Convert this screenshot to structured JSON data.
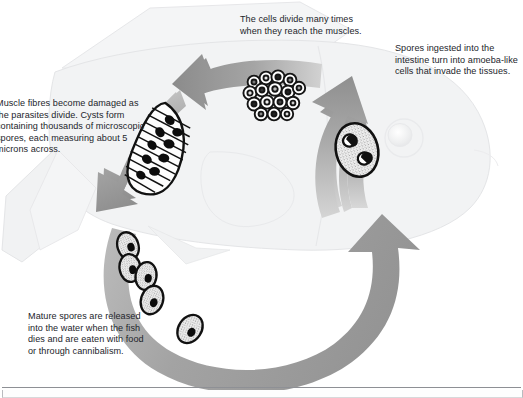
{
  "diagram": {
    "background_color": "#ffffff",
    "arrow_color": "#9a9a9a",
    "arrow_color_light": "#c9c9c9",
    "fish_color": "#f2f3f4",
    "fish_outline_color": "#e3e4e6",
    "text_color": "#23252b"
  },
  "captions": {
    "muscle": "Muscle fibres become damaged as the parasites divide. Cysts form containing thousands of microscopic spores, each measuring about 5 microns across.",
    "divide": "The cells divide many times when they reach the muscles.",
    "ingest": "Spores ingested into the intestine turn into amoeba-like cells that invade the tissues.",
    "mature": "Mature spores are released into the water when the fish dies and are eaten with food or through cannibalism."
  },
  "stages": [
    {
      "id": "ingested-spore",
      "label": "amoeba-like cell with two nuclei",
      "position": "right-arrow",
      "nuclei": 2
    },
    {
      "id": "dividing-cells",
      "label": "cluster of dividing cells",
      "position": "top-arrow",
      "cell_count": 16
    },
    {
      "id": "muscle-cyst",
      "label": "cyst in muscle fibre containing spores",
      "position": "left-arrow",
      "spore_count": 9
    },
    {
      "id": "mature-spores",
      "label": "mature spores released into water",
      "position": "bottom-arc",
      "spore_count": 5
    }
  ],
  "arrows": [
    {
      "id": "arrow-ingest-up",
      "direction": "up",
      "description": "spores enter fish and travel up"
    },
    {
      "id": "arrow-to-muscles",
      "direction": "left",
      "description": "cells divide toward muscles"
    },
    {
      "id": "arrow-cyst-down",
      "direction": "down-left",
      "description": "cysts form in muscle"
    },
    {
      "id": "arrow-release-arc",
      "direction": "clockwise-up",
      "description": "spores released, re-ingested"
    }
  ],
  "icons": {
    "spore": "spore-icon",
    "cell_cluster": "cell-cluster-icon",
    "cyst": "cyst-icon",
    "fish": "fish-icon"
  }
}
